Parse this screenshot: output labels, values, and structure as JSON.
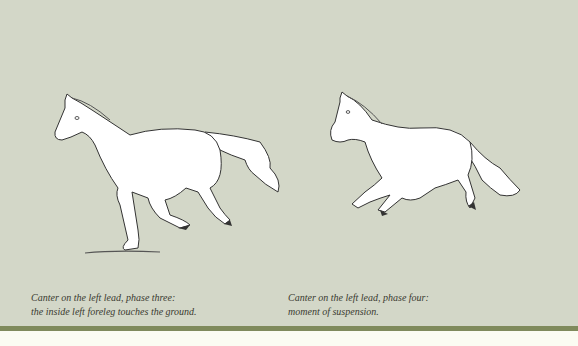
{
  "page": {
    "background_color": "#d3d7c8",
    "band_color": "#7f8a5c",
    "footer_color": "#fbfcf2"
  },
  "figures": [
    {
      "name": "horse-canter-phase-three",
      "caption": {
        "line1": "Canter on the left lead, phase three:",
        "line2": "the inside left foreleg touches the ground."
      }
    },
    {
      "name": "horse-canter-phase-four",
      "caption": {
        "line1": "Canter on the left lead, phase four:",
        "line2": "moment of suspension."
      }
    }
  ]
}
